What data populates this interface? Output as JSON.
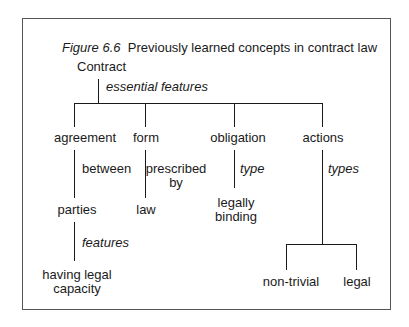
{
  "figure": {
    "label": "Figure 6.6",
    "title": "Previously learned concepts in contract law"
  },
  "tree": {
    "root": "Contract",
    "root_relation": "essential features",
    "branches": [
      {
        "label": "agreement",
        "relation": "between",
        "child": "parties",
        "child_relation": "features",
        "grandchild": "having legal capacity",
        "grandchild_lines": [
          "having legal",
          "capacity"
        ]
      },
      {
        "label": "form",
        "relation": "prescribed by",
        "relation_lines": [
          "prescribed",
          "by"
        ],
        "child": "law"
      },
      {
        "label": "obligation",
        "relation": "type",
        "child": "legally binding",
        "child_lines": [
          "legally",
          "binding"
        ]
      },
      {
        "label": "actions",
        "relation": "types",
        "children": [
          "non-trivial",
          "legal"
        ]
      }
    ]
  }
}
